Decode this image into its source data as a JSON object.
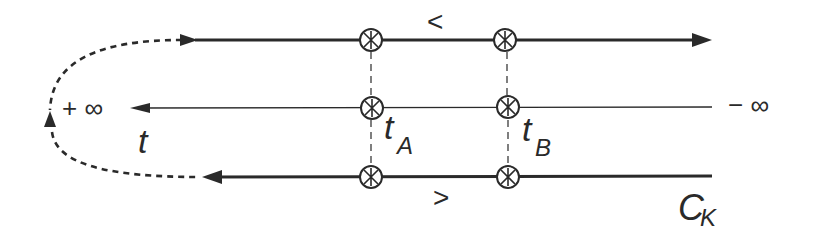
{
  "diagram": {
    "colors": {
      "stroke": "#2a2a2a",
      "background": "#ffffff"
    },
    "labels": {
      "plus_infinity": "+ ∞",
      "minus_infinity": "− ∞",
      "time_axis": "t",
      "t_a_base": "t",
      "t_a_sub": "A",
      "t_b_base": "t",
      "t_b_sub": "B",
      "upper_branch": "<",
      "lower_branch": ">",
      "contour_base": "C",
      "contour_sub": "K"
    },
    "branches": [
      {
        "name": "upper-branch",
        "direction": "right",
        "y": 40
      },
      {
        "name": "time-axis",
        "direction": "left",
        "y": 108
      },
      {
        "name": "lower-branch",
        "direction": "left",
        "y": 177
      }
    ],
    "crossing_points": [
      {
        "name": "t_A",
        "x": 371
      },
      {
        "name": "t_B",
        "x": 508
      }
    ]
  }
}
